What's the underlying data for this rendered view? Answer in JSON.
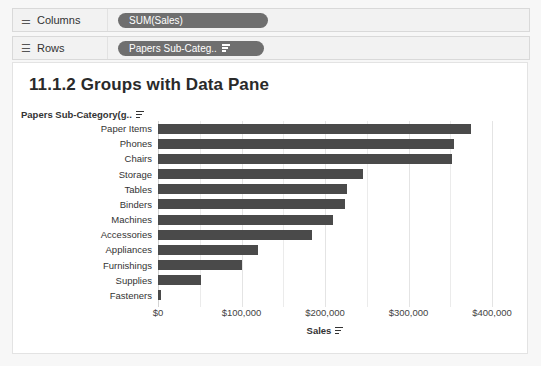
{
  "shelves": [
    {
      "id": "columns",
      "label": "Columns",
      "icon": "columns-icon",
      "pill": {
        "text": "SUM(Sales)",
        "has_sort_icon": false,
        "color": "#6f6f6f"
      }
    },
    {
      "id": "rows",
      "label": "Rows",
      "icon": "rows-icon",
      "pill": {
        "text": "Papers Sub-Categ..",
        "has_sort_icon": true,
        "color": "#6f6f6f"
      }
    }
  ],
  "view": {
    "title": "11.1.2 Groups with Data Pane",
    "row_axis_header": "Papers Sub-Category(g..",
    "row_axis_sort_icon": "sort-icon"
  },
  "chart_data": {
    "type": "bar",
    "orientation": "horizontal",
    "title": "11.1.2 Groups with Data Pane",
    "xlabel": "Sales",
    "ylabel": "Papers Sub-Category(g..",
    "xlim": [
      0,
      400000
    ],
    "xticks": [
      0,
      100000,
      200000,
      300000,
      400000
    ],
    "xtick_labels": [
      "$0",
      "$100,000",
      "$200,000",
      "$300,000",
      "$400,000"
    ],
    "grid": true,
    "minor_gridlines": true,
    "legend": "none",
    "bar_color": "#4a4a4a",
    "categories": [
      "Paper Items",
      "Phones",
      "Chairs",
      "Storage",
      "Tables",
      "Binders",
      "Machines",
      "Accessories",
      "Appliances",
      "Furnishings",
      "Supplies",
      "Fasteners"
    ],
    "values": [
      375000,
      355000,
      352000,
      245000,
      226000,
      224000,
      210000,
      185000,
      120000,
      101000,
      51000,
      3000
    ]
  }
}
